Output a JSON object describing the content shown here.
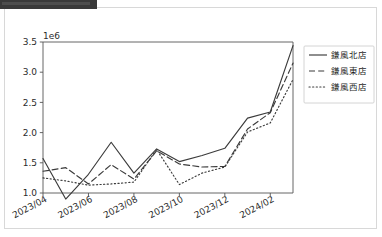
{
  "window": {
    "banner_label": ""
  },
  "chart_data": {
    "type": "line",
    "title": "",
    "xlabel": "",
    "ylabel": "",
    "y_exponent_label": "1e6",
    "ylim": [
      1000000,
      3500000
    ],
    "ytick_labels": [
      "3.5",
      "3.0",
      "2.5",
      "2.0",
      "1.5",
      "1.0"
    ],
    "ytick_values": [
      3500000,
      3000000,
      2500000,
      2000000,
      1500000,
      1000000
    ],
    "grid": false,
    "legend_position": "right",
    "x": [
      "2023/04",
      "2023/05",
      "2023/06",
      "2023/07",
      "2023/08",
      "2023/09",
      "2023/10",
      "2023/11",
      "2023/12",
      "2024/01",
      "2024/02",
      "2024/03"
    ],
    "xtick_labels": [
      "2023/04",
      "2023/06",
      "2023/08",
      "2023/10",
      "2023/12",
      "2024/02"
    ],
    "xtick_indices": [
      0,
      2,
      4,
      6,
      8,
      10
    ],
    "series": [
      {
        "name": "鎌風北店",
        "style": "solid",
        "values": [
          1570000,
          900000,
          1310000,
          1840000,
          1330000,
          1730000,
          1520000,
          1620000,
          1740000,
          2240000,
          2340000,
          3440000
        ]
      },
      {
        "name": "鎌風東店",
        "style": "dashed",
        "values": [
          1360000,
          1420000,
          1150000,
          1470000,
          1230000,
          1700000,
          1480000,
          1430000,
          1440000,
          2060000,
          2330000,
          3150000
        ]
      },
      {
        "name": "鎌風西店",
        "style": "dotted",
        "values": [
          1250000,
          1200000,
          1130000,
          1150000,
          1180000,
          1720000,
          1140000,
          1330000,
          1430000,
          2010000,
          2160000,
          2880000
        ]
      }
    ]
  },
  "colors": {
    "line": "#3b3b3b",
    "axis": "#555555",
    "card_border": "#d8d8d8",
    "banner": "#3a3a3a",
    "background": "#ffffff"
  }
}
